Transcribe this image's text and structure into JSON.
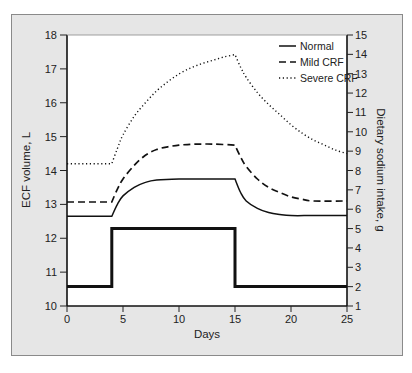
{
  "chart_data": {
    "type": "line",
    "title": "",
    "xlabel": "Days",
    "ylabel_left": "ECF volume, L",
    "ylabel_right": "Dietary sodium intake, g",
    "xlim": [
      0,
      25
    ],
    "ylim_left": [
      10,
      18
    ],
    "ylim_right": [
      1,
      15
    ],
    "x_ticks": [
      0,
      5,
      10,
      15,
      20,
      25
    ],
    "y_ticks_left": [
      10,
      11,
      12,
      13,
      14,
      15,
      16,
      17,
      18
    ],
    "y_ticks_right": [
      1,
      2,
      3,
      4,
      5,
      6,
      7,
      8,
      9,
      10,
      11,
      12,
      13,
      14,
      15
    ],
    "grid": false,
    "legend_position": "upper right",
    "legend": [
      {
        "name": "Normal",
        "style": "solid"
      },
      {
        "name": "Mild CRF",
        "style": "dashed"
      },
      {
        "name": "Severe CRF",
        "style": "dotted"
      }
    ],
    "series": [
      {
        "name": "Normal",
        "axis": "left",
        "style": "solid",
        "x": [
          0,
          4,
          4.5,
          5,
          6,
          7,
          8,
          10,
          12,
          15,
          15.5,
          16,
          17,
          18,
          19,
          20,
          22,
          25
        ],
        "values": [
          12.65,
          12.65,
          13.0,
          13.25,
          13.5,
          13.65,
          13.72,
          13.75,
          13.75,
          13.75,
          13.35,
          13.1,
          12.88,
          12.76,
          12.7,
          12.67,
          12.67,
          12.67
        ]
      },
      {
        "name": "Mild CRF",
        "axis": "left",
        "style": "dashed",
        "x": [
          0,
          4,
          4.5,
          5,
          6,
          7,
          8,
          9,
          10,
          11,
          12,
          13,
          15,
          15.5,
          16,
          17,
          18,
          19,
          20,
          21,
          22,
          25
        ],
        "values": [
          13.07,
          13.07,
          13.45,
          13.75,
          14.15,
          14.45,
          14.62,
          14.7,
          14.75,
          14.77,
          14.78,
          14.78,
          14.75,
          14.4,
          14.12,
          13.75,
          13.5,
          13.35,
          13.22,
          13.15,
          13.1,
          13.1
        ]
      },
      {
        "name": "Severe CRF",
        "axis": "left",
        "style": "dotted",
        "x": [
          0,
          4,
          4.5,
          5,
          6,
          7,
          8,
          9,
          10,
          11,
          12,
          13,
          14,
          15,
          15.5,
          16,
          17,
          18,
          19,
          20,
          21,
          22,
          23,
          24,
          25
        ],
        "values": [
          14.2,
          14.2,
          14.65,
          15.05,
          15.6,
          16.0,
          16.35,
          16.62,
          16.85,
          17.02,
          17.15,
          17.25,
          17.35,
          17.42,
          17.05,
          16.75,
          16.3,
          15.95,
          15.65,
          15.35,
          15.1,
          14.9,
          14.75,
          14.6,
          14.5
        ]
      },
      {
        "name": "Dietary sodium intake",
        "axis": "right",
        "style": "solid-thick",
        "x": [
          0,
          4,
          4,
          15,
          15,
          25
        ],
        "values": [
          2,
          2,
          5,
          5,
          2,
          2
        ]
      }
    ]
  }
}
